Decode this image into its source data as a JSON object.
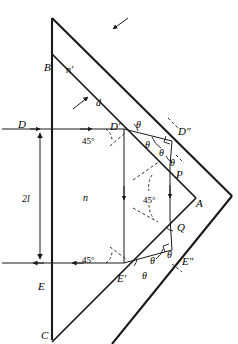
{
  "figure": {
    "type": "optics-ray-diagram",
    "stroke_color": "#1a1a1a",
    "background_color": "#ffffff",
    "points": [
      {
        "name": "B",
        "label": "B",
        "x": 44,
        "y": 62
      },
      {
        "name": "C",
        "label": "C",
        "x": 41,
        "y": 330
      },
      {
        "name": "D",
        "label": "D",
        "x": 18,
        "y": 119
      },
      {
        "name": "E",
        "label": "E",
        "x": 38,
        "y": 281
      },
      {
        "name": "A",
        "label": "A",
        "x": 196,
        "y": 198
      },
      {
        "name": "Dp",
        "label": "D'",
        "x": 110,
        "y": 121
      },
      {
        "name": "Dpp",
        "label": "D\"",
        "x": 178,
        "y": 126
      },
      {
        "name": "Ep",
        "label": "E'",
        "x": 117,
        "y": 273
      },
      {
        "name": "Epp",
        "label": "E\"",
        "x": 182,
        "y": 256
      },
      {
        "name": "P",
        "label": "P",
        "x": 176,
        "y": 169
      },
      {
        "name": "Q",
        "label": "Q",
        "x": 177,
        "y": 222
      }
    ],
    "media_labels": [
      {
        "name": "n-prime",
        "label": "n'",
        "x": 66,
        "y": 65
      },
      {
        "name": "d",
        "label": "d",
        "x": 96,
        "y": 98
      },
      {
        "name": "n",
        "label": "n",
        "x": 83,
        "y": 193
      }
    ],
    "dimension": {
      "name": "2l",
      "label": "2l",
      "x": 22,
      "y": 194
    },
    "angles_45": [
      {
        "name": "angle-45-upper",
        "label": "45°",
        "x": 82,
        "y": 137
      },
      {
        "name": "angle-45-mid",
        "label": "45°",
        "x": 143,
        "y": 196
      },
      {
        "name": "angle-45-lower",
        "label": "45°",
        "x": 82,
        "y": 256
      }
    ],
    "angles_theta": [
      {
        "name": "theta-d-prime-right",
        "label": "θ",
        "x": 136,
        "y": 120
      },
      {
        "name": "theta-d-prime-lower",
        "label": "θ",
        "x": 145,
        "y": 140
      },
      {
        "name": "theta-d-double-left",
        "label": "θ",
        "x": 159,
        "y": 148
      },
      {
        "name": "theta-p",
        "label": "θ",
        "x": 170,
        "y": 158
      },
      {
        "name": "theta-e-prime-upper",
        "label": "θ",
        "x": 150,
        "y": 256
      },
      {
        "name": "theta-e-double-upper",
        "label": "θ",
        "x": 167,
        "y": 250
      },
      {
        "name": "theta-e-prime-lower",
        "label": "θ",
        "x": 142,
        "y": 271
      }
    ]
  }
}
